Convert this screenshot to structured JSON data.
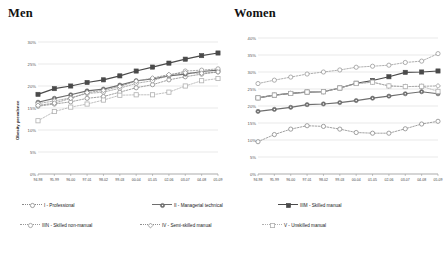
{
  "charts": {
    "men": {
      "title": "Men",
      "ylabel": "Obesity prevalence"
    },
    "women": {
      "title": "Women",
      "ylabel": ""
    }
  },
  "legend": {
    "items": [
      {
        "key": "I",
        "label": "I - Professional",
        "marker": "circle-open",
        "color": "#8a8a8a",
        "dash": "dotted"
      },
      {
        "key": "II",
        "label": "II - Managerial technical",
        "marker": "circle-filled",
        "color": "#6e6e6e",
        "dash": "solid"
      },
      {
        "key": "IIIM",
        "label": "IIIM - Skilled manual",
        "marker": "square-filled",
        "color": "#4a4a4a",
        "dash": "solid"
      },
      {
        "key": "IIIN",
        "label": "IIIN - Skilled non-manual",
        "marker": "circle-open",
        "color": "#9a9a9a",
        "dash": "dotted"
      },
      {
        "key": "IV",
        "label": "IV - Semi-skilled manual",
        "marker": "diamond-open",
        "color": "#8f8f8f",
        "dash": "dotted"
      },
      {
        "key": "V",
        "label": "V - Unskilled manual",
        "marker": "square-open",
        "color": "#b0b0b0",
        "dash": "dotted"
      }
    ]
  },
  "chart_data": [
    {
      "type": "line",
      "title": "Men",
      "xlabel": "",
      "ylabel": "Obesity prevalence",
      "ylim": [
        0,
        30
      ],
      "yticks": [
        "0%",
        "5%",
        "10%",
        "15%",
        "20%",
        "25%",
        "30%"
      ],
      "ytick_values": [
        0,
        5,
        10,
        15,
        20,
        25,
        30
      ],
      "grid": true,
      "legend_position": "bottom",
      "categories": [
        "94-98",
        "95-99",
        "96-00",
        "97-01",
        "98-02",
        "99-03",
        "00-04",
        "01-05",
        "02-06",
        "03-07",
        "04-08",
        "05-09"
      ],
      "series": [
        {
          "name": "I - Professional",
          "values": [
            15.4,
            15.9,
            16.4,
            17.2,
            17.6,
            18.6,
            19.6,
            20.3,
            21.4,
            22.1,
            22.7,
            23.2
          ]
        },
        {
          "name": "II - Managerial technical",
          "values": [
            16.3,
            17.2,
            18.0,
            18.9,
            19.3,
            20.2,
            21.2,
            21.6,
            22.3,
            22.7,
            23.3,
            23.6
          ]
        },
        {
          "name": "IIIM - Skilled manual",
          "values": [
            18.1,
            19.4,
            20.0,
            20.8,
            21.4,
            22.3,
            23.4,
            24.3,
            25.2,
            26.1,
            26.9,
            27.5
          ]
        },
        {
          "name": "IIIN - Skilled non-manual",
          "values": [
            16.0,
            16.6,
            17.3,
            18.3,
            18.6,
            19.5,
            20.6,
            21.2,
            22.4,
            23.4,
            23.6,
            23.9
          ]
        },
        {
          "name": "IV - Semi-skilled manual",
          "values": [
            15.6,
            16.1,
            17.2,
            18.5,
            19.0,
            19.9,
            21.1,
            21.8,
            22.6,
            23.0,
            22.9,
            23.2
          ]
        },
        {
          "name": "V - Unskilled manual",
          "values": [
            12.1,
            14.2,
            15.2,
            15.9,
            16.8,
            17.9,
            18.0,
            18.0,
            18.6,
            20.0,
            21.2,
            21.7
          ]
        }
      ]
    },
    {
      "type": "line",
      "title": "Women",
      "xlabel": "",
      "ylabel": "",
      "ylim": [
        0,
        40
      ],
      "yticks": [
        "0%",
        "5%",
        "10%",
        "15%",
        "20%",
        "25%",
        "30%",
        "35%",
        "40%"
      ],
      "ytick_values": [
        0,
        5,
        10,
        15,
        20,
        25,
        30,
        35,
        40
      ],
      "grid": true,
      "legend_position": "bottom",
      "categories": [
        "94-98",
        "95-99",
        "96-00",
        "97-01",
        "98-02",
        "99-03",
        "00-04",
        "01-05",
        "02-06",
        "03-07",
        "04-08",
        "05-09"
      ],
      "series": [
        {
          "name": "I - Professional",
          "values": [
            9.5,
            11.6,
            13.2,
            14.2,
            14.0,
            13.2,
            12.2,
            12.0,
            12.0,
            13.3,
            14.7,
            15.5
          ]
        },
        {
          "name": "II - Managerial technical",
          "values": [
            18.4,
            19.0,
            19.6,
            20.4,
            20.6,
            21.0,
            21.6,
            22.3,
            22.9,
            23.6,
            24.2,
            23.6
          ]
        },
        {
          "name": "IIIM - Skilled manual",
          "values": [
            22.4,
            23.2,
            23.7,
            24.1,
            24.2,
            25.3,
            26.7,
            27.5,
            28.6,
            29.9,
            30.0,
            30.3
          ]
        },
        {
          "name": "IIIN - Skilled non-manual",
          "values": [
            26.6,
            27.6,
            28.5,
            29.4,
            30.0,
            30.6,
            31.4,
            31.7,
            32.0,
            32.8,
            33.2,
            35.4
          ]
        },
        {
          "name": "IV - Semi-skilled manual",
          "values": [
            22.4,
            23.2,
            23.7,
            24.1,
            24.2,
            25.3,
            26.6,
            27.0,
            25.9,
            25.7,
            25.8,
            25.9
          ]
        },
        {
          "name": "V - Unskilled manual",
          "values": [
            22.4,
            23.2,
            23.7,
            24.1,
            24.2,
            25.3,
            26.6,
            27.0,
            25.9,
            25.7,
            25.8,
            24.3
          ]
        }
      ]
    }
  ]
}
